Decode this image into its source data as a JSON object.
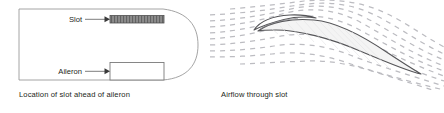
{
  "figure": {
    "panels": [
      {
        "id": "wing-planform",
        "caption": "Location of slot ahead of aileron",
        "labels": [
          {
            "id": "slot",
            "text": "Slot"
          },
          {
            "id": "aileron",
            "text": "Aileron"
          }
        ],
        "parts": [
          {
            "id": "slot-strip",
            "name": "hatched-slot-rectangle"
          },
          {
            "id": "aileron-box",
            "name": "aileron-rectangle"
          },
          {
            "id": "wing-outline",
            "name": "wing-planform-outline"
          }
        ]
      },
      {
        "id": "airfoil-section",
        "caption": "Airflow through slot",
        "labels": [],
        "parts": [
          {
            "id": "airfoil-body",
            "name": "airfoil-cross-section"
          },
          {
            "id": "leading-edge-slat",
            "name": "leading-edge-slat"
          },
          {
            "id": "streamlines",
            "name": "dashed-airflow-streamlines"
          }
        ]
      }
    ]
  },
  "colors": {
    "ink": "#231f20",
    "outline": "#808080",
    "slot_fill": "#8c8c8c",
    "slot_hatch": "#5a5a5a",
    "airfoil_stroke": "#4d4d4d",
    "airfoil_fill": "#f2f2f2",
    "streamline": "#b9b9bd",
    "background": "#ffffff"
  }
}
